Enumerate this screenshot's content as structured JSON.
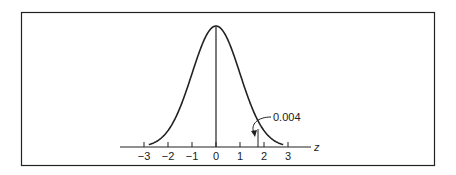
{
  "chart_data": {
    "type": "line",
    "title": "",
    "xlabel": "z",
    "ylabel": "",
    "xlim": [
      -3.3,
      4.0
    ],
    "x_ticks": [
      -3,
      -2,
      -1,
      0,
      1,
      2,
      3
    ],
    "x_tick_labels": [
      "−3",
      "−2",
      "−1",
      "0",
      "1",
      "2",
      "3"
    ],
    "series": [
      {
        "name": "standard normal density",
        "function": "exp(-z^2/2)/sqrt(2*pi)",
        "x_range": [
          -2.8,
          2.8
        ]
      }
    ],
    "reference_lines": [
      {
        "x": 0,
        "type": "vertical",
        "label": "mean"
      },
      {
        "x": 1.8,
        "type": "vertical",
        "label": "cutoff"
      }
    ],
    "annotations": [
      {
        "text": "0.004",
        "points_to": "tail area right of cutoff",
        "x": 2.1
      }
    ],
    "grid": false,
    "legend": null
  },
  "axis": {
    "name": "z",
    "ticks": [
      "−3",
      "−2",
      "−1",
      "0",
      "1",
      "2",
      "3"
    ]
  },
  "annotation": {
    "label": "0.004"
  }
}
